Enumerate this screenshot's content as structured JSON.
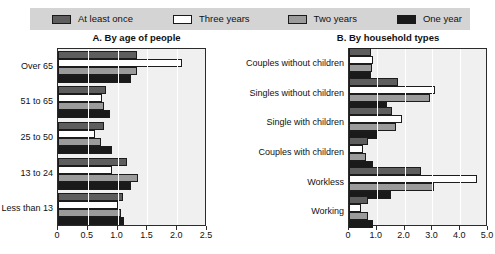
{
  "legend": {
    "items": [
      {
        "label": "At least once",
        "color": "#5e5e5e",
        "key": "at_least_once"
      },
      {
        "label": "Three years",
        "color": "#ffffff",
        "key": "three_years"
      },
      {
        "label": "Two years",
        "color": "#9b9b9b",
        "key": "two_years"
      },
      {
        "label": "One year",
        "color": "#1a1a1a",
        "key": "one_year"
      }
    ]
  },
  "chart_data": [
    {
      "type": "bar",
      "orientation": "horizontal",
      "panel": "A",
      "title": "A. By age of people",
      "xlabel": "",
      "ylabel": "",
      "xlim": [
        0,
        2.5
      ],
      "xticks": [
        0,
        0.5,
        1.0,
        1.5,
        2.0,
        2.5
      ],
      "xticklabels": [
        "0",
        "0.5",
        "1.0",
        "1.5",
        "2.0",
        "2.5"
      ],
      "grid": true,
      "legend_position": "top",
      "categories": [
        "Over 65",
        "51 to 65",
        "25 to 50",
        "13 to 24",
        "Less than 13"
      ],
      "series": [
        {
          "name": "At least once",
          "color": "#5e5e5e",
          "values": [
            1.32,
            0.8,
            0.78,
            1.16,
            1.09
          ]
        },
        {
          "name": "Three years",
          "color": "#ffffff",
          "values": [
            2.08,
            0.74,
            0.62,
            0.9,
            1.0
          ]
        },
        {
          "name": "Two years",
          "color": "#9b9b9b",
          "values": [
            1.32,
            0.78,
            0.72,
            1.34,
            1.05
          ]
        },
        {
          "name": "One year",
          "color": "#1a1a1a",
          "values": [
            1.23,
            0.87,
            0.9,
            1.23,
            1.1
          ]
        }
      ]
    },
    {
      "type": "bar",
      "orientation": "horizontal",
      "panel": "B",
      "title": "B. By household types",
      "xlabel": "",
      "ylabel": "",
      "xlim": [
        0,
        5.0
      ],
      "xticks": [
        0,
        1.0,
        2.0,
        3.0,
        4.0,
        5.0
      ],
      "xticklabels": [
        "0",
        "1.0",
        "2.0",
        "3.0",
        "4.0",
        "5.0"
      ],
      "grid": true,
      "legend_position": "top",
      "categories": [
        "Couples without children",
        "Singles without children",
        "Single with children",
        "Couples with children",
        "Workless",
        "Working"
      ],
      "series": [
        {
          "name": "At least once",
          "color": "#5e5e5e",
          "values": [
            0.8,
            1.75,
            1.55,
            0.7,
            2.6,
            0.7
          ]
        },
        {
          "name": "Three years",
          "color": "#ffffff",
          "values": [
            0.88,
            3.1,
            1.9,
            0.5,
            4.6,
            0.42
          ]
        },
        {
          "name": "Two years",
          "color": "#9b9b9b",
          "values": [
            0.84,
            2.9,
            1.7,
            0.6,
            3.05,
            0.68
          ]
        },
        {
          "name": "One year",
          "color": "#1a1a1a",
          "values": [
            0.78,
            1.35,
            1.05,
            0.85,
            1.5,
            0.88
          ]
        }
      ]
    }
  ]
}
